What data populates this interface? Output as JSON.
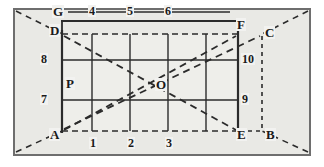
{
  "figure": {
    "type": "geometry-diagram",
    "background_color": "#ffffff",
    "panel_color": "#e9e9e5",
    "line_color": "#2b2b2b",
    "border_color": "#555555",
    "points": [
      {
        "id": "G",
        "label": "G",
        "x": 58,
        "y": 12
      },
      {
        "id": "D",
        "label": "D",
        "x": 55,
        "y": 31
      },
      {
        "id": "F",
        "label": "F",
        "x": 240,
        "y": 26
      },
      {
        "id": "C",
        "label": "C",
        "x": 268,
        "y": 33
      },
      {
        "id": "A",
        "label": "A",
        "x": 55,
        "y": 135
      },
      {
        "id": "E",
        "label": "E",
        "x": 240,
        "y": 136
      },
      {
        "id": "B",
        "label": "B",
        "x": 269,
        "y": 136
      },
      {
        "id": "O",
        "label": "O",
        "x": 160,
        "y": 84
      },
      {
        "id": "P",
        "label": "P",
        "x": 69,
        "y": 83
      }
    ],
    "top_axis_labels": [
      {
        "label": "4",
        "x": 92
      },
      {
        "label": "5",
        "x": 130
      },
      {
        "label": "6",
        "x": 168
      }
    ],
    "bottom_axis_labels": [
      {
        "label": "1",
        "x": 92
      },
      {
        "label": "2",
        "x": 130
      },
      {
        "label": "3",
        "x": 168
      }
    ],
    "left_axis_labels": [
      {
        "label": "8",
        "y": 60
      },
      {
        "label": "7",
        "y": 100
      }
    ],
    "right_axis_labels": [
      {
        "label": "10",
        "y": 60
      },
      {
        "label": "9",
        "y": 100
      }
    ],
    "grid": {
      "left": 62,
      "right": 238,
      "top": 34,
      "bottom": 131,
      "vertical_lines": [
        92,
        130,
        168,
        206
      ],
      "horizontal_lines": [
        60,
        100
      ]
    }
  }
}
